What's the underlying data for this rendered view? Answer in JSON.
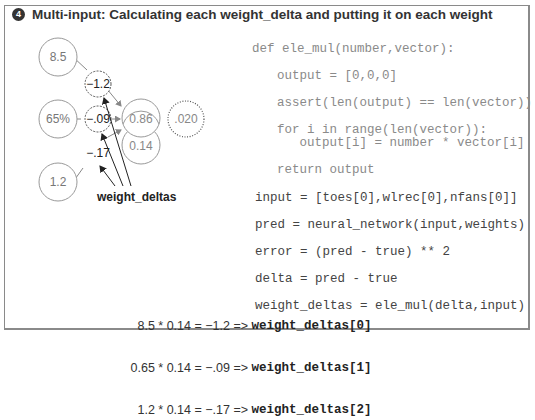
{
  "title": {
    "badge": "4",
    "text": "Multi-input: Calculating each weight_delta and putting it on each weight"
  },
  "diagram": {
    "inputs": [
      "8.5",
      "65%",
      "1.2"
    ],
    "weight_deltas": [
      "−1.2",
      "−.09",
      "−.17"
    ],
    "prediction": "0.86",
    "delta": "0.14",
    "error": ".020",
    "label": "weight_deltas"
  },
  "code": {
    "lines": [
      "def ele_mul(number,vector):",
      "output = [0,0,0]",
      "assert(len(output) == len(vector))",
      "for i in range(len(vector)):",
      "   output[i] = number * vector[i]",
      "return output",
      "input = [toes[0],wlrec[0],nfans[0]]",
      "pred = neural_network(input,weights)",
      "error = (pred - true) ** 2",
      "delta = pred - true",
      "weight_deltas = ele_mul(delta,input)"
    ]
  },
  "equations": [
    {
      "expr": "8.5 * 0.14 = −1.2 =>",
      "target": "weight_deltas[0]"
    },
    {
      "expr": "0.65 * 0.14 = −.09 =>",
      "target": "weight_deltas[1]"
    },
    {
      "expr": "1.2 * 0.14 = −.17 =>",
      "target": "weight_deltas[2]"
    }
  ],
  "colors": {
    "border": "#8a8a8a",
    "light_text": "#8a8a8a",
    "dark_text": "#333333"
  }
}
